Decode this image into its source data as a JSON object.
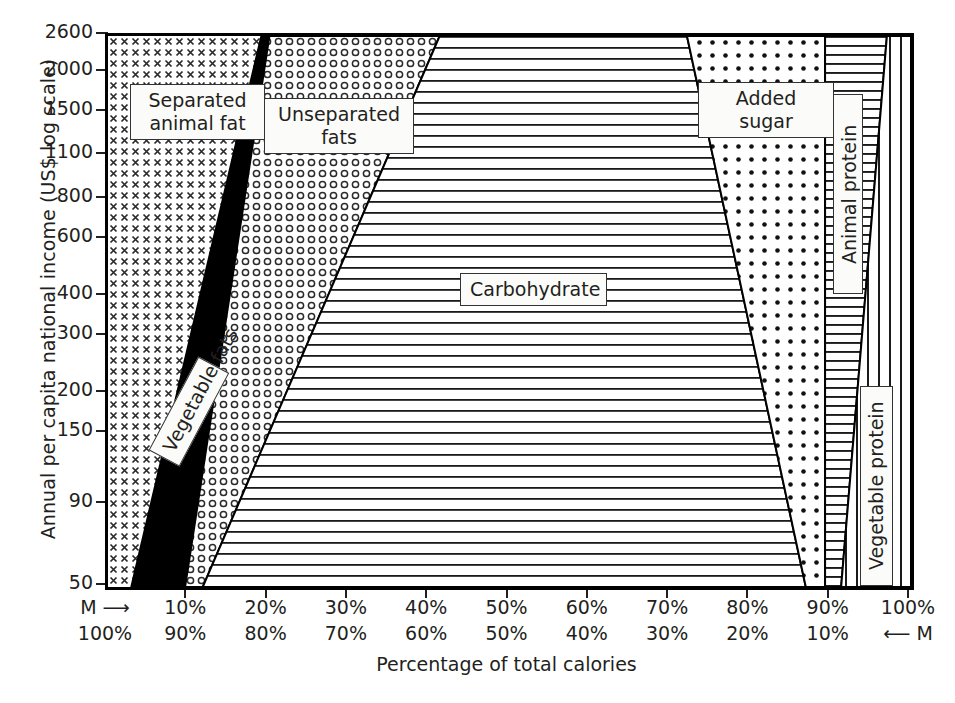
{
  "chart_data": {
    "type": "area",
    "title": "",
    "xlabel": "Percentage of total calories",
    "ylabel": "Annual per capita national income (US$ log scale)",
    "yscale": "log",
    "ylim": [
      50,
      2600
    ],
    "xlim": [
      0,
      100
    ],
    "grid": false,
    "legend": "inline-callouts",
    "y_ticks": [
      {
        "value": 2600,
        "label": "2600"
      },
      {
        "value": 2000,
        "label": "2000"
      },
      {
        "value": 1500,
        "label": "1500"
      },
      {
        "value": 1100,
        "label": "1100"
      },
      {
        "value": 800,
        "label": "800"
      },
      {
        "value": 600,
        "label": "600"
      },
      {
        "value": 400,
        "label": "400"
      },
      {
        "value": 300,
        "label": "300"
      },
      {
        "value": 200,
        "label": "200"
      },
      {
        "value": 150,
        "label": "150"
      },
      {
        "value": 90,
        "label": "90"
      },
      {
        "value": 50,
        "label": "50"
      }
    ],
    "x_ticks_top": [
      "M ⟶",
      "10%",
      "20%",
      "30%",
      "40%",
      "50%",
      "60%",
      "70%",
      "80%",
      "90%",
      "100%"
    ],
    "x_ticks_bottom": [
      "100%",
      "90%",
      "80%",
      "70%",
      "60%",
      "50%",
      "40%",
      "30%",
      "20%",
      "10%",
      "⟵ M"
    ],
    "x_tick_values": [
      0,
      10,
      20,
      30,
      40,
      50,
      60,
      70,
      80,
      90,
      100
    ],
    "bands": [
      {
        "name": "Separated animal fat",
        "label": "Separated\nanimal fat",
        "fill": "cross-hatch-dots",
        "x_at_top_pct": 19.1,
        "x_at_bottom_pct": 2.9,
        "start_pct": 0
      },
      {
        "name": "Vegetable fats",
        "label": "Vegetable fats",
        "fill": "solid-black",
        "x_at_top_pct": 20.1,
        "x_at_bottom_pct": 9.6,
        "start_pct": 19.1
      },
      {
        "name": "Unseparated fats",
        "label": "Unseparated\nfats",
        "fill": "small-circles",
        "x_at_top_pct": 41.3,
        "x_at_bottom_pct": 11.8,
        "start_pct": 20.1
      },
      {
        "name": "Carbohydrate",
        "label": "Carbohydrate",
        "fill": "horizontal-lines",
        "x_at_top_pct": 72.1,
        "x_at_bottom_pct": 86.9,
        "start_pct": 41.3
      },
      {
        "name": "Added sugar",
        "label": "Added sugar",
        "fill": "dots",
        "x_at_top_pct": 89.3,
        "x_at_bottom_pct": 89.3,
        "start_pct": 72.1
      },
      {
        "name": "Animal protein",
        "label": "Animal protein",
        "fill": "horizontal-lines",
        "x_at_top_pct": 97.0,
        "x_at_bottom_pct": 91.3,
        "start_pct": 89.3
      },
      {
        "name": "Vegetable protein",
        "label": "Vegetable protein",
        "fill": "vertical-lines",
        "x_at_top_pct": 100,
        "x_at_bottom_pct": 100,
        "start_pct": 97.0
      }
    ]
  },
  "axes": {
    "y_title": "Annual per capita national income (US$ log scale)",
    "x_title": "Percentage of total calories"
  },
  "labels": {
    "separated_animal_fat": "Separated\nanimal fat",
    "vegetable_fats": "Vegetable fats",
    "unseparated_fats": "Unseparated\nfats",
    "carbohydrate": "Carbohydrate",
    "added_sugar": "Added sugar",
    "animal_protein": "Animal protein",
    "vegetable_protein": "Vegetable protein"
  },
  "colors": {
    "ink": "#231f20",
    "paper": "#ffffff",
    "solid_fill": "#000000",
    "callout_bg": "#fbfbf9"
  }
}
